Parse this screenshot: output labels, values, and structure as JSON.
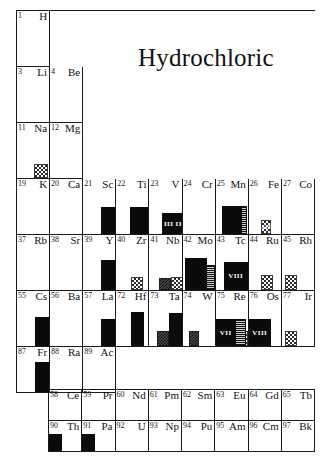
{
  "title": "Hydrochloric",
  "colors": {
    "grid_line": "#1a1a1a",
    "bar_solid": "#0b0b0b",
    "page_background": "#ffffff",
    "text": "#111111"
  },
  "main_table": {
    "name": "periodic-table-main",
    "column_count": 9,
    "rows": [
      {
        "name": "period-1",
        "cells": [
          {
            "number": "1",
            "symbol": "H",
            "bars": []
          },
          {
            "number": "",
            "symbol": "",
            "blank": true
          },
          {
            "number": "",
            "symbol": "",
            "blank": true
          },
          {
            "number": "",
            "symbol": "",
            "blank": true
          },
          {
            "number": "",
            "symbol": "",
            "blank": true
          },
          {
            "number": "",
            "symbol": "",
            "blank": true
          },
          {
            "number": "",
            "symbol": "",
            "blank": true
          },
          {
            "number": "",
            "symbol": "",
            "blank": true
          },
          {
            "number": "",
            "symbol": "",
            "blank": true
          }
        ]
      },
      {
        "name": "period-2",
        "cells": [
          {
            "number": "3",
            "symbol": "Li",
            "bars": []
          },
          {
            "number": "4",
            "symbol": "Be",
            "bars": []
          },
          {
            "number": "",
            "symbol": "",
            "blank": true
          },
          {
            "number": "",
            "symbol": "",
            "blank": true
          },
          {
            "number": "",
            "symbol": "",
            "blank": true
          },
          {
            "number": "",
            "symbol": "",
            "blank": true
          },
          {
            "number": "",
            "symbol": "",
            "blank": true
          },
          {
            "number": "",
            "symbol": "",
            "blank": true
          },
          {
            "number": "",
            "symbol": "",
            "blank": true
          }
        ]
      },
      {
        "name": "period-3",
        "cells": [
          {
            "number": "11",
            "symbol": "Na",
            "bars": [
              {
                "style": "check",
                "left": 17,
                "width": 14,
                "height": 14,
                "label": ""
              }
            ]
          },
          {
            "number": "12",
            "symbol": "Mg",
            "bars": []
          },
          {
            "number": "",
            "symbol": "",
            "blank": true
          },
          {
            "number": "",
            "symbol": "",
            "blank": true
          },
          {
            "number": "",
            "symbol": "",
            "blank": true
          },
          {
            "number": "",
            "symbol": "",
            "blank": true
          },
          {
            "number": "",
            "symbol": "",
            "blank": true
          },
          {
            "number": "",
            "symbol": "",
            "blank": true
          },
          {
            "number": "",
            "symbol": "",
            "blank": true
          }
        ]
      },
      {
        "name": "period-4",
        "cells": [
          {
            "number": "19",
            "symbol": "K",
            "bars": []
          },
          {
            "number": "20",
            "symbol": "Ca",
            "bars": []
          },
          {
            "number": "21",
            "symbol": "Sc",
            "bars": [
              {
                "style": "solid",
                "left": 18,
                "width": 14,
                "height": 27,
                "label": ""
              }
            ]
          },
          {
            "number": "22",
            "symbol": "Ti",
            "bars": [
              {
                "style": "solid",
                "left": 14,
                "width": 24,
                "height": 27,
                "label": ""
              }
            ]
          },
          {
            "number": "23",
            "symbol": "V",
            "bars": [
              {
                "style": "solid",
                "left": 13,
                "width": 24,
                "height": 21,
                "label": "III III"
              }
            ]
          },
          {
            "number": "24",
            "symbol": "Cr",
            "bars": []
          },
          {
            "number": "25",
            "symbol": "Mn",
            "bars": [
              {
                "style": "solid",
                "left": 6,
                "width": 20,
                "height": 28,
                "label": ""
              },
              {
                "style": "vstripe",
                "left": 20,
                "width": 11,
                "height": 28,
                "label": ""
              }
            ]
          },
          {
            "number": "26",
            "symbol": "Fe",
            "bars": [
              {
                "style": "check",
                "left": 12,
                "width": 10,
                "height": 14,
                "label": "III"
              }
            ]
          },
          {
            "number": "27",
            "symbol": "Co",
            "bars": []
          }
        ]
      },
      {
        "name": "period-5",
        "cells": [
          {
            "number": "37",
            "symbol": "Rb",
            "bars": []
          },
          {
            "number": "38",
            "symbol": "Sr",
            "bars": []
          },
          {
            "number": "39",
            "symbol": "Y",
            "bars": [
              {
                "style": "solid",
                "left": 18,
                "width": 14,
                "height": 30,
                "label": ""
              },
              {
                "style": "check",
                "left": 18,
                "width": 14,
                "height": 13,
                "label": ""
              }
            ]
          },
          {
            "number": "40",
            "symbol": "Zr",
            "bars": [
              {
                "style": "check",
                "left": 15,
                "width": 12,
                "height": 13,
                "label": ""
              }
            ]
          },
          {
            "number": "41",
            "symbol": "Nb",
            "bars": [
              {
                "style": "dense",
                "left": 10,
                "width": 12,
                "height": 12,
                "label": ""
              },
              {
                "style": "check",
                "left": 22,
                "width": 12,
                "height": 13,
                "label": ""
              }
            ]
          },
          {
            "number": "42",
            "symbol": "Mo",
            "bars": [
              {
                "style": "solid",
                "left": 2,
                "width": 22,
                "height": 32,
                "label": ""
              },
              {
                "style": "vstripe",
                "left": 21,
                "width": 11,
                "height": 25,
                "label": ""
              }
            ]
          },
          {
            "number": "43",
            "symbol": "Tc",
            "bars": [
              {
                "style": "solid",
                "left": 8,
                "width": 24,
                "height": 28,
                "label": "VIII"
              },
              {
                "style": "check",
                "left": 10,
                "width": 12,
                "height": 13,
                "label": ""
              }
            ]
          },
          {
            "number": "44",
            "symbol": "Ru",
            "bars": [
              {
                "style": "check",
                "left": 12,
                "width": 12,
                "height": 15,
                "label": ""
              }
            ]
          },
          {
            "number": "45",
            "symbol": "Rh",
            "bars": [
              {
                "style": "check",
                "left": 3,
                "width": 12,
                "height": 15,
                "label": ""
              }
            ]
          }
        ]
      },
      {
        "name": "period-6",
        "cells": [
          {
            "number": "55",
            "symbol": "Cs",
            "bars": [
              {
                "style": "solid",
                "left": 18,
                "width": 14,
                "height": 29,
                "label": ""
              }
            ]
          },
          {
            "number": "56",
            "symbol": "Ba",
            "bars": []
          },
          {
            "number": "57",
            "symbol": "La",
            "bars": [
              {
                "style": "solid",
                "left": 18,
                "width": 14,
                "height": 27,
                "label": ""
              }
            ]
          },
          {
            "number": "72",
            "symbol": "Hf",
            "bars": [
              {
                "style": "solid",
                "left": 15,
                "width": 13,
                "height": 34,
                "label": ""
              },
              {
                "style": "check",
                "left": 15,
                "width": 13,
                "height": 15,
                "label": ""
              }
            ]
          },
          {
            "number": "73",
            "symbol": "Ta",
            "bars": [
              {
                "style": "solid",
                "left": 20,
                "width": 13,
                "height": 33,
                "label": ""
              },
              {
                "style": "dense",
                "left": 8,
                "width": 12,
                "height": 15,
                "label": ""
              },
              {
                "style": "check",
                "left": 20,
                "width": 13,
                "height": 15,
                "label": ""
              }
            ]
          },
          {
            "number": "74",
            "symbol": "W",
            "bars": [
              {
                "style": "dense",
                "left": 6,
                "width": 10,
                "height": 15,
                "label": ""
              }
            ]
          },
          {
            "number": "75",
            "symbol": "Re",
            "bars": [
              {
                "style": "solid",
                "left": 0,
                "width": 20,
                "height": 27,
                "label": "VII"
              },
              {
                "style": "vstripe",
                "left": 19,
                "width": 11,
                "height": 27,
                "label": ""
              },
              {
                "style": "check",
                "left": 20,
                "width": 12,
                "height": 15,
                "label": ""
              }
            ]
          },
          {
            "number": "76",
            "symbol": "Os",
            "bars": [
              {
                "style": "solid",
                "left": 0,
                "width": 22,
                "height": 27,
                "label": "VIII"
              }
            ]
          },
          {
            "number": "77",
            "symbol": "Ir",
            "bars": [
              {
                "style": "check",
                "left": 3,
                "width": 12,
                "height": 15,
                "label": ""
              }
            ]
          }
        ]
      },
      {
        "name": "period-7",
        "cells": [
          {
            "number": "87",
            "symbol": "Fr",
            "bars": [
              {
                "style": "solid",
                "left": 18,
                "width": 14,
                "height": 30,
                "label": ""
              }
            ]
          },
          {
            "number": "88",
            "symbol": "Ra",
            "bars": []
          },
          {
            "number": "89",
            "symbol": "Ac",
            "bars": []
          },
          {
            "number": "",
            "symbol": "",
            "blank": true
          },
          {
            "number": "",
            "symbol": "",
            "blank": true
          },
          {
            "number": "",
            "symbol": "",
            "blank": true
          },
          {
            "number": "",
            "symbol": "",
            "blank": true
          },
          {
            "number": "",
            "symbol": "",
            "blank": true
          },
          {
            "number": "",
            "symbol": "",
            "blank": true
          }
        ]
      }
    ]
  },
  "f_block_table": {
    "name": "periodic-table-f-block",
    "column_count": 8,
    "rows": [
      {
        "name": "lanthanides",
        "cells": [
          {
            "number": "58",
            "symbol": "Ce",
            "bars": []
          },
          {
            "number": "59",
            "symbol": "Pr",
            "bars": []
          },
          {
            "number": "60",
            "symbol": "Nd",
            "bars": []
          },
          {
            "number": "61",
            "symbol": "Pm",
            "bars": []
          },
          {
            "number": "62",
            "symbol": "Sm",
            "bars": []
          },
          {
            "number": "63",
            "symbol": "Eu",
            "bars": []
          },
          {
            "number": "64",
            "symbol": "Gd",
            "bars": []
          },
          {
            "number": "65",
            "symbol": "Tb",
            "bars": []
          }
        ]
      },
      {
        "name": "actinides",
        "cells": [
          {
            "number": "90",
            "symbol": "Th",
            "bars": [
              {
                "style": "solid",
                "left": 0,
                "width": 13,
                "height": 17,
                "label": ""
              }
            ]
          },
          {
            "number": "91",
            "symbol": "Pa",
            "bars": [
              {
                "style": "solid",
                "left": 0,
                "width": 13,
                "height": 17,
                "label": ""
              }
            ]
          },
          {
            "number": "92",
            "symbol": "U",
            "bars": []
          },
          {
            "number": "93",
            "symbol": "Np",
            "bars": []
          },
          {
            "number": "94",
            "symbol": "Pu",
            "bars": []
          },
          {
            "number": "95",
            "symbol": "Am",
            "bars": []
          },
          {
            "number": "96",
            "symbol": "Cm",
            "bars": []
          },
          {
            "number": "97",
            "symbol": "Bk",
            "bars": []
          }
        ]
      }
    ]
  }
}
